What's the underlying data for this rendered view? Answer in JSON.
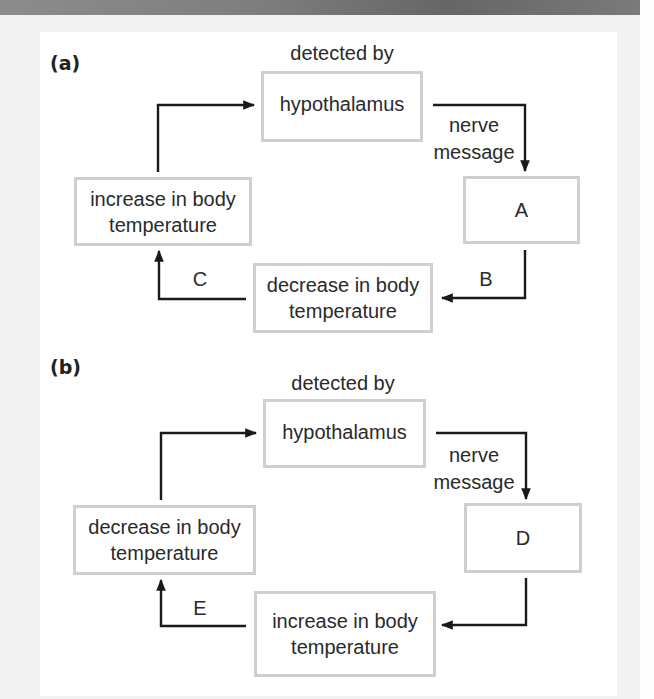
{
  "diagram": {
    "panels": [
      {
        "id": "a",
        "label": "(a)",
        "detector_caption": "detected by",
        "sensor_box": "hypothalamus",
        "signal_caption_line1": "nerve",
        "signal_caption_line2": "message",
        "effector_box": "A",
        "change_box_line1": "decrease in body",
        "change_box_line2": "temperature",
        "stimulus_box_line1": "increase in body",
        "stimulus_box_line2": "temperature",
        "arrow_label_right": "B",
        "arrow_label_left": "C"
      },
      {
        "id": "b",
        "label": "(b)",
        "detector_caption": "detected by",
        "sensor_box": "hypothalamus",
        "signal_caption_line1": "nerve",
        "signal_caption_line2": "message",
        "effector_box": "D",
        "change_box_line1": "increase in body",
        "change_box_line2": "temperature",
        "stimulus_box_line1": "decrease in body",
        "stimulus_box_line2": "temperature",
        "arrow_label_left": "E"
      }
    ],
    "colors": {
      "box_border": "#cfcfcf",
      "arrow": "#1a1a1a",
      "text": "#2a2a2a",
      "page_background": "#f2f2f2",
      "panel_background": "#ffffff"
    }
  }
}
